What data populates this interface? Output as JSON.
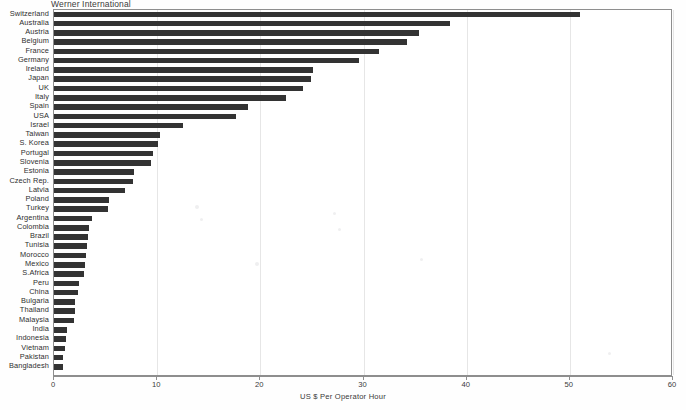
{
  "chart_data": {
    "type": "bar",
    "orientation": "horizontal",
    "title": "Werner International",
    "xlabel": "US $ Per Operator Hour",
    "ylabel": "",
    "xlim": [
      0,
      60
    ],
    "xticks": [
      0,
      10,
      20,
      30,
      40,
      50,
      60
    ],
    "grid": true,
    "legend": "none",
    "bar_color": "#333333",
    "categories": [
      "Switzerland",
      "Australia",
      "Austria",
      "Belgium",
      "France",
      "Germany",
      "Ireland",
      "Japan",
      "UK",
      "Italy",
      "Spain",
      "USA",
      "Israel",
      "Taiwan",
      "S. Korea",
      "Portugal",
      "Slovenia",
      "Estonia",
      "Czech Rep.",
      "Latvia",
      "Poland",
      "Turkey",
      "Argentina",
      "Colombia",
      "Brazil",
      "Tunisia",
      "Morocco",
      "Mexico",
      "S.Africa",
      "Peru",
      "China",
      "Bulgaria",
      "Thailand",
      "Malaysia",
      "India",
      "Indonesia",
      "Vietnam",
      "Pakistan",
      "Bangladesh"
    ],
    "values": [
      51.0,
      38.4,
      35.4,
      34.2,
      31.5,
      29.6,
      25.1,
      24.9,
      24.1,
      22.5,
      18.8,
      17.6,
      12.5,
      10.3,
      10.1,
      9.6,
      9.4,
      7.8,
      7.7,
      6.9,
      5.3,
      5.2,
      3.7,
      3.4,
      3.3,
      3.2,
      3.1,
      3.0,
      2.9,
      2.4,
      2.3,
      2.0,
      2.0,
      1.9,
      1.3,
      1.2,
      1.1,
      0.9,
      0.85
    ]
  },
  "axis": {
    "tick_labels": [
      "0",
      "10",
      "20",
      "30",
      "40",
      "50",
      "60"
    ],
    "title": "US $ Per Operator Hour"
  },
  "header": {
    "title": "Werner International"
  }
}
